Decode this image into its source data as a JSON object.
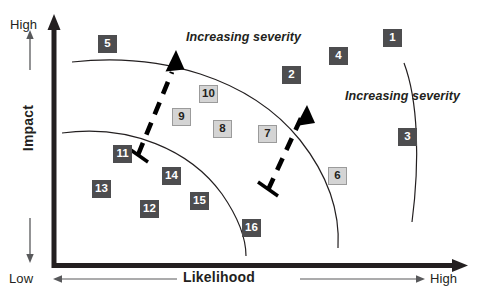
{
  "figure": {
    "type": "risk-matrix-scatter",
    "background": "#ffffff",
    "axes": {
      "y": {
        "title": "Impact",
        "top_label": "High",
        "bottom_label": "Low",
        "color": "#231f20"
      },
      "x": {
        "title": "Likelihood",
        "low_label": "Low",
        "high_label": "High",
        "color": "#231f20"
      }
    },
    "annotations": [
      {
        "id": "severity-1",
        "text": "Increasing severity"
      },
      {
        "id": "severity-2",
        "text": "Increasing severity"
      }
    ],
    "colors": {
      "dark_box_fill": "#4d4d4f",
      "dark_box_text": "#ffffff",
      "light_box_fill": "#d4d4d4",
      "light_box_text": "#231f20",
      "light_box_border": "#9b9b9b",
      "axis": "#231f20",
      "band_curve": "#231f20",
      "dashed_arrow": "#000000"
    },
    "risks": [
      {
        "label": "1",
        "tone": "dark",
        "x": 383,
        "y": 29
      },
      {
        "label": "2",
        "tone": "dark",
        "x": 282,
        "y": 66
      },
      {
        "label": "3",
        "tone": "dark",
        "x": 398,
        "y": 128
      },
      {
        "label": "4",
        "tone": "dark",
        "x": 329,
        "y": 47
      },
      {
        "label": "5",
        "tone": "dark",
        "x": 98,
        "y": 35
      },
      {
        "label": "6",
        "tone": "light",
        "x": 328,
        "y": 167
      },
      {
        "label": "7",
        "tone": "light",
        "x": 258,
        "y": 125
      },
      {
        "label": "8",
        "tone": "light",
        "x": 213,
        "y": 120
      },
      {
        "label": "9",
        "tone": "light",
        "x": 172,
        "y": 108
      },
      {
        "label": "10",
        "tone": "light",
        "x": 199,
        "y": 85
      },
      {
        "label": "11",
        "tone": "dark",
        "x": 113,
        "y": 145
      },
      {
        "label": "12",
        "tone": "dark",
        "x": 140,
        "y": 200
      },
      {
        "label": "13",
        "tone": "dark",
        "x": 92,
        "y": 180
      },
      {
        "label": "14",
        "tone": "dark",
        "x": 162,
        "y": 167
      },
      {
        "label": "15",
        "tone": "dark",
        "x": 190,
        "y": 192
      },
      {
        "label": "16",
        "tone": "dark",
        "x": 242,
        "y": 219
      }
    ]
  },
  "chart_data": {
    "type": "scatter",
    "title": "",
    "xlabel": "Likelihood",
    "ylabel": "Impact",
    "xlim": [
      0,
      1
    ],
    "ylim": [
      0,
      1
    ],
    "grid": false,
    "legend": null,
    "annotations": [
      "Increasing severity",
      "Increasing severity"
    ],
    "axis_tick_labels": {
      "x": [
        "Low",
        "High"
      ],
      "y": [
        "Low",
        "High"
      ]
    },
    "points": [
      {
        "label": "1",
        "likelihood": 0.83,
        "impact": 0.92,
        "band": "high",
        "tone": "dark"
      },
      {
        "label": "2",
        "likelihood": 0.58,
        "impact": 0.78,
        "band": "high",
        "tone": "dark"
      },
      {
        "label": "3",
        "likelihood": 0.87,
        "impact": 0.54,
        "band": "high",
        "tone": "dark"
      },
      {
        "label": "4",
        "likelihood": 0.69,
        "impact": 0.85,
        "band": "high",
        "tone": "dark"
      },
      {
        "label": "5",
        "likelihood": 0.11,
        "impact": 0.89,
        "band": "high",
        "tone": "dark"
      },
      {
        "label": "6",
        "likelihood": 0.69,
        "impact": 0.37,
        "band": "medium",
        "tone": "light"
      },
      {
        "label": "7",
        "likelihood": 0.52,
        "impact": 0.53,
        "band": "medium",
        "tone": "light"
      },
      {
        "label": "8",
        "likelihood": 0.41,
        "impact": 0.55,
        "band": "medium",
        "tone": "light"
      },
      {
        "label": "9",
        "likelihood": 0.31,
        "impact": 0.6,
        "band": "medium",
        "tone": "light"
      },
      {
        "label": "10",
        "likelihood": 0.37,
        "impact": 0.69,
        "band": "medium",
        "tone": "light"
      },
      {
        "label": "11",
        "likelihood": 0.16,
        "impact": 0.45,
        "band": "low",
        "tone": "dark"
      },
      {
        "label": "12",
        "likelihood": 0.24,
        "impact": 0.25,
        "band": "low",
        "tone": "dark"
      },
      {
        "label": "13",
        "likelihood": 0.09,
        "impact": 0.33,
        "band": "low",
        "tone": "dark"
      },
      {
        "label": "14",
        "likelihood": 0.29,
        "impact": 0.38,
        "band": "low",
        "tone": "dark"
      },
      {
        "label": "15",
        "likelihood": 0.36,
        "impact": 0.29,
        "band": "low",
        "tone": "dark"
      },
      {
        "label": "16",
        "likelihood": 0.49,
        "impact": 0.19,
        "band": "low",
        "tone": "dark"
      }
    ]
  }
}
